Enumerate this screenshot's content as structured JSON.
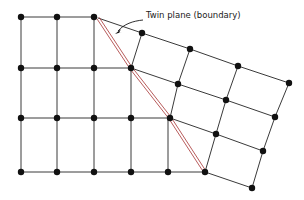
{
  "figure": {
    "name": "twin-plane-lattice-diagram",
    "background_color": "#ffffff",
    "width": 304,
    "height": 200
  },
  "annotation": {
    "label": "Twin plane (boundary)",
    "label_x": 146,
    "label_y": 18,
    "leader": "M143,20 C133,21 124,24 118,31",
    "arrow_tip_x": 115,
    "arrow_tip_y": 34,
    "arrow": "M115,34 L121,29 L119,33 L122,32 Z",
    "leader_color": "#1a1a1a"
  },
  "style": {
    "lattice_line_color": "#3a3a3a",
    "lattice_line_width": 1.0,
    "node_color": "#111111",
    "node_radius": 3.2,
    "twin_plane_color": "#b04a4a",
    "twin_plane_width": 0.9,
    "twin_plane_gap": 2.6
  },
  "twin_plane": {
    "name": "twin-plane-boundary",
    "points": [
      [
        98,
        18
      ],
      [
        131,
        68
      ],
      [
        170,
        118
      ],
      [
        205,
        172
      ]
    ],
    "double_line": true
  },
  "left_lattice": {
    "name": "parent-crystal-square-lattice",
    "description": "square lattice left of twin plane",
    "cell_size": 36.6,
    "origin_x": 21,
    "origin_y": 17,
    "segments": [
      [
        [
          21,
          17
        ],
        [
          94,
          17
        ]
      ],
      [
        [
          21,
          68
        ],
        [
          131,
          68
        ]
      ],
      [
        [
          21,
          118
        ],
        [
          170,
          118
        ]
      ],
      [
        [
          21,
          172
        ],
        [
          205,
          172
        ]
      ],
      [
        [
          21,
          17
        ],
        [
          21,
          172
        ]
      ],
      [
        [
          57,
          17
        ],
        [
          57,
          172
        ]
      ],
      [
        [
          94,
          17
        ],
        [
          94,
          172
        ]
      ],
      [
        [
          131,
          68
        ],
        [
          131,
          172
        ]
      ],
      [
        [
          168,
          118
        ],
        [
          168,
          172
        ]
      ]
    ],
    "nodes": [
      [
        21,
        17
      ],
      [
        57,
        17
      ],
      [
        94,
        17
      ],
      [
        21,
        68
      ],
      [
        57,
        68
      ],
      [
        94,
        68
      ],
      [
        131,
        68
      ],
      [
        21,
        118
      ],
      [
        57,
        118
      ],
      [
        94,
        118
      ],
      [
        131,
        118
      ],
      [
        170,
        118
      ],
      [
        21,
        172
      ],
      [
        57,
        172
      ],
      [
        94,
        172
      ],
      [
        131,
        172
      ],
      [
        168,
        172
      ],
      [
        205,
        172
      ]
    ]
  },
  "right_lattice": {
    "name": "twin-crystal-sheared-lattice",
    "description": "rotated / sheared lattice right of twin plane",
    "segments": [
      [
        [
          98,
          18
        ],
        [
          142,
          33
        ]
      ],
      [
        [
          142,
          33
        ],
        [
          190,
          49
        ]
      ],
      [
        [
          190,
          49
        ],
        [
          238,
          66
        ]
      ],
      [
        [
          238,
          66
        ],
        [
          289,
          83
        ]
      ],
      [
        [
          131,
          68
        ],
        [
          178,
          84
        ]
      ],
      [
        [
          178,
          84
        ],
        [
          226,
          100
        ]
      ],
      [
        [
          226,
          100
        ],
        [
          275,
          117
        ]
      ],
      [
        [
          170,
          118
        ],
        [
          216,
          134
        ]
      ],
      [
        [
          216,
          134
        ],
        [
          263,
          151
        ]
      ],
      [
        [
          205,
          172
        ],
        [
          252,
          188
        ]
      ],
      [
        [
          142,
          33
        ],
        [
          131,
          68
        ]
      ],
      [
        [
          190,
          49
        ],
        [
          178,
          84
        ]
      ],
      [
        [
          238,
          66
        ],
        [
          226,
          100
        ]
      ],
      [
        [
          289,
          83
        ],
        [
          275,
          117
        ]
      ],
      [
        [
          178,
          84
        ],
        [
          170,
          118
        ]
      ],
      [
        [
          226,
          100
        ],
        [
          216,
          134
        ]
      ],
      [
        [
          275,
          117
        ],
        [
          263,
          151
        ]
      ],
      [
        [
          216,
          134
        ],
        [
          205,
          172
        ]
      ],
      [
        [
          263,
          151
        ],
        [
          252,
          188
        ]
      ]
    ],
    "nodes": [
      [
        142,
        33
      ],
      [
        190,
        49
      ],
      [
        238,
        66
      ],
      [
        289,
        83
      ],
      [
        178,
        84
      ],
      [
        226,
        100
      ],
      [
        275,
        117
      ],
      [
        216,
        134
      ],
      [
        263,
        151
      ],
      [
        252,
        188
      ]
    ]
  }
}
